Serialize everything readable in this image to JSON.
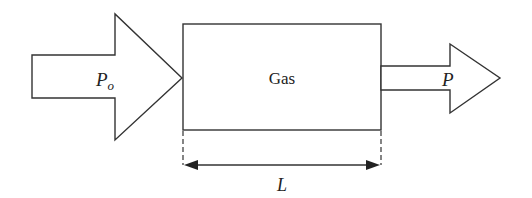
{
  "diagram": {
    "inlet_label": "P",
    "inlet_subscript": "o",
    "chamber_label": "Gas",
    "outlet_label": "P",
    "length_label": "L"
  },
  "colors": {
    "stroke": "#333333",
    "background": "#ffffff"
  }
}
